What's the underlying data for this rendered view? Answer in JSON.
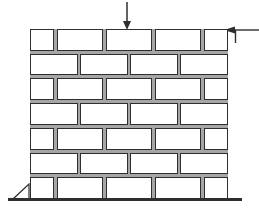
{
  "diagram": {
    "line_color": "#2e2e2e",
    "background_color": "#ffffff",
    "wall": {
      "bond": "running",
      "course_count": 7,
      "brick_color": "#ffffff",
      "mortar_color": "#a6a6a6",
      "rows": [
        {
          "bricks": [
            1,
            2,
            2,
            2,
            1
          ]
        },
        {
          "bricks": [
            2,
            2,
            2,
            2
          ]
        },
        {
          "bricks": [
            1,
            2,
            2,
            2,
            1
          ]
        },
        {
          "bricks": [
            2,
            2,
            2,
            2
          ]
        },
        {
          "bricks": [
            1,
            2,
            2,
            2,
            1
          ]
        },
        {
          "bricks": [
            2,
            2,
            2,
            2
          ]
        },
        {
          "bricks": [
            1,
            2,
            2,
            2,
            1
          ]
        }
      ]
    },
    "loads": [
      {
        "id": "vertical-load",
        "direction": "down",
        "position": "top-center"
      },
      {
        "id": "horizontal-load",
        "direction": "left",
        "position": "top-right-corner"
      }
    ],
    "support": {
      "type": "wedge-triangle",
      "position": "bottom-left"
    },
    "ground": {
      "present": true,
      "position": "bottom"
    }
  }
}
